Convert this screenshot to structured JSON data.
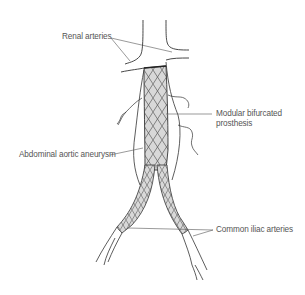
{
  "figure": {
    "labels": {
      "renal_arteries": "Renal arteries",
      "modular_prosthesis_line1": "Modular bifurcated",
      "modular_prosthesis_line2": "prosthesis",
      "abdominal_aortic_aneurysm": "Abdominal aortic aneurysm",
      "common_iliac_arteries": "Common iliac arteries"
    },
    "colors": {
      "line": "#333333",
      "label_text": "#555555",
      "leader_line": "#555555",
      "stent_fill": "#d8d8d8",
      "mesh": "#444444",
      "background": "#ffffff"
    }
  }
}
